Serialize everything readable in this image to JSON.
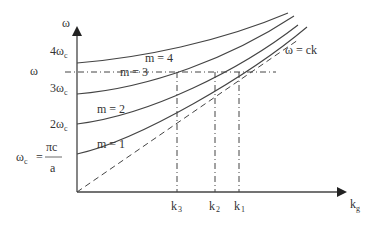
{
  "diagram": {
    "axes": {
      "y_label": "ω",
      "x_label": "k",
      "x_label_sub": "g"
    },
    "y_ticks": [
      {
        "label": "4ω",
        "sub": "c"
      },
      {
        "label": "3ω",
        "sub": "c"
      },
      {
        "label": "2ω",
        "sub": "c"
      }
    ],
    "omega_c_def": {
      "lhs": "ω",
      "lhs_sub": "c",
      "eq": "=",
      "numerator": "πc",
      "denominator": "a"
    },
    "omega_level_label": "ω",
    "light_line_label": "ω = ck",
    "curves": [
      {
        "name": "mode-4",
        "label": "m = 4"
      },
      {
        "name": "mode-3",
        "label": "m = 3"
      },
      {
        "name": "mode-2",
        "label": "m = 2"
      },
      {
        "name": "mode-1",
        "label": "m = 1"
      }
    ],
    "x_markers": [
      {
        "label": "k",
        "sub": "3"
      },
      {
        "label": "k",
        "sub": "2"
      },
      {
        "label": "k",
        "sub": "1"
      }
    ],
    "colors": {
      "line": "#444444",
      "text": "#333333",
      "background": "#ffffff"
    }
  }
}
